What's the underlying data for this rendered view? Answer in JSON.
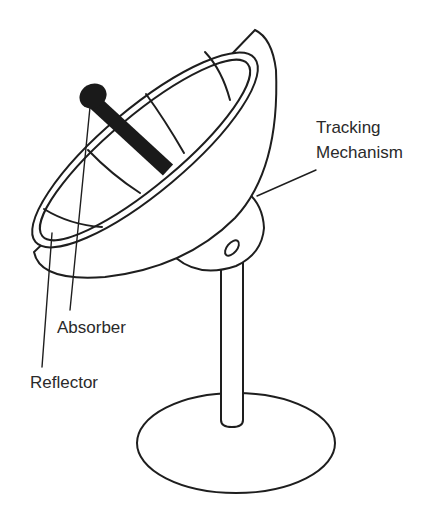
{
  "diagram": {
    "labels": {
      "tracking_line1": "Tracking",
      "tracking_line2": "Mechanism",
      "absorber": "Absorber",
      "reflector": "Reflector"
    },
    "colors": {
      "stroke": "#1e1e1e",
      "absorber_fill": "#1a1a1a",
      "text": "#2a2a2a",
      "background": "#ffffff"
    }
  }
}
